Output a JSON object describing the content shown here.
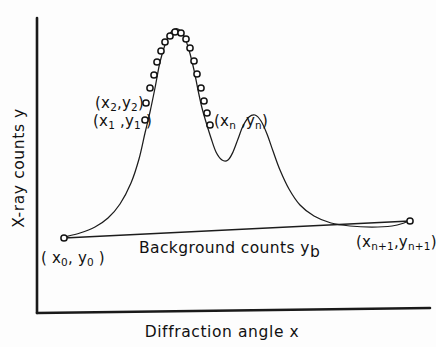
{
  "figure": {
    "axes": {
      "y_axis_label": "X-ray counts y",
      "x_axis_label": "Diffraction angle x"
    },
    "annotations": {
      "point_0": {
        "base": "( x",
        "sub1": "0",
        "mid": ", y",
        "sub2": "0",
        "close": " )"
      },
      "point_1": {
        "base": "(x",
        "sub1": "1",
        "mid": " ,y",
        "sub2": "1",
        "close": " )"
      },
      "point_2": {
        "base": "(x",
        "sub1": "2",
        "mid": ",y",
        "sub2": "2",
        "close": ")"
      },
      "point_n": {
        "base": "(x",
        "sub1": "n",
        "mid": " ,y",
        "sub2": "n",
        "close": ")"
      },
      "point_n_plus_1": {
        "base": "(x",
        "sub1": "n+1",
        "mid": ",y",
        "sub2": "n+1",
        "close": ")"
      },
      "background": {
        "base": "Background counts y",
        "sub1": "b"
      }
    },
    "colors": {
      "ink": "#111111",
      "paper": "#fdfdfd",
      "marker_fill": "#ffffff"
    }
  },
  "chart_data": {
    "type": "line",
    "title": "",
    "xlabel": "Diffraction angle x",
    "ylabel": "X-ray counts y",
    "grid": false,
    "legend": null,
    "axis_ranges": {
      "x_pixels": [
        37,
        430
      ],
      "y_pixels": [
        18,
        313
      ]
    },
    "series": [
      {
        "name": "diffraction-profile",
        "comment": "Curve path control points in SVG pixel coordinates",
        "path_points": [
          [
            64,
            237
          ],
          [
            80,
            233
          ],
          [
            95,
            227
          ],
          [
            108,
            218
          ],
          [
            120,
            204
          ],
          [
            131,
            183
          ],
          [
            139,
            159
          ],
          [
            145,
            133
          ],
          [
            150,
            112
          ],
          [
            155,
            88
          ],
          [
            160,
            62
          ],
          [
            166,
            42
          ],
          [
            172,
            31
          ],
          [
            178,
            29
          ],
          [
            184,
            36
          ],
          [
            189,
            50
          ],
          [
            194,
            70
          ],
          [
            198,
            90
          ],
          [
            202,
            108
          ],
          [
            206,
            122
          ],
          [
            211,
            138
          ],
          [
            216,
            152
          ],
          [
            222,
            160
          ],
          [
            228,
            160
          ],
          [
            233,
            152
          ],
          [
            238,
            139
          ],
          [
            243,
            126
          ],
          [
            249,
            117
          ],
          [
            255,
            115
          ],
          [
            261,
            121
          ],
          [
            267,
            134
          ],
          [
            273,
            151
          ],
          [
            280,
            170
          ],
          [
            289,
            189
          ],
          [
            300,
            205
          ],
          [
            314,
            216
          ],
          [
            331,
            223
          ],
          [
            350,
            226
          ],
          [
            372,
            227
          ],
          [
            392,
            226
          ],
          [
            404,
            223
          ],
          [
            410,
            220
          ]
        ]
      },
      {
        "name": "background-line",
        "comment": "Straight background counts line endpoints",
        "path_points": [
          [
            64,
            238
          ],
          [
            410,
            221
          ]
        ]
      }
    ],
    "markers": {
      "name": "sampled-counts",
      "style": "open-circle",
      "points": [
        {
          "label": "point_0",
          "x": 64,
          "y": 238
        },
        {
          "label": "point_1",
          "x": 145,
          "y": 120
        },
        {
          "label": "point_2",
          "x": 146,
          "y": 103
        },
        {
          "label": null,
          "x": 150,
          "y": 88
        },
        {
          "label": null,
          "x": 154,
          "y": 75
        },
        {
          "label": null,
          "x": 157,
          "y": 62
        },
        {
          "label": null,
          "x": 161,
          "y": 51
        },
        {
          "label": null,
          "x": 165,
          "y": 42
        },
        {
          "label": null,
          "x": 170,
          "y": 36
        },
        {
          "label": null,
          "x": 175,
          "y": 32
        },
        {
          "label": null,
          "x": 181,
          "y": 33
        },
        {
          "label": null,
          "x": 186,
          "y": 39
        },
        {
          "label": null,
          "x": 190,
          "y": 48
        },
        {
          "label": null,
          "x": 194,
          "y": 61
        },
        {
          "label": null,
          "x": 197,
          "y": 74
        },
        {
          "label": null,
          "x": 201,
          "y": 88
        },
        {
          "label": null,
          "x": 204,
          "y": 101
        },
        {
          "label": null,
          "x": 207,
          "y": 113
        },
        {
          "label": "point_n",
          "x": 210,
          "y": 125
        },
        {
          "label": "point_n_plus_1",
          "x": 410,
          "y": 221
        }
      ]
    }
  }
}
